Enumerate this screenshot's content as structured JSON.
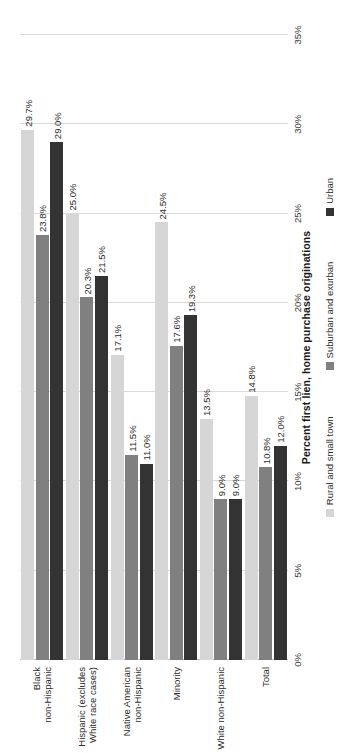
{
  "chart_data": {
    "type": "bar",
    "orientation": "horizontal",
    "title": "",
    "xlabel": "Percent first lien, home purchase originations",
    "ylabel": "",
    "xlim": [
      0,
      35
    ],
    "xticks": [
      "0%",
      "5%",
      "10%",
      "15%",
      "20%",
      "25%",
      "30%",
      "35%"
    ],
    "xtick_values": [
      0,
      5,
      10,
      15,
      20,
      25,
      30,
      35
    ],
    "grid": true,
    "legend_position": "bottom",
    "categories": [
      "Black\nnon-Hispanic",
      "Hispanic (excludes\nWhite race cases)",
      "Native American\nnon-Hispanic",
      "Minority",
      "White non-Hispanic",
      "Total"
    ],
    "series": [
      {
        "name": "Rural and small town",
        "color": "#d6d6d6",
        "values": [
          29.7,
          25.0,
          17.1,
          24.5,
          13.5,
          14.8
        ],
        "labels": [
          "29.7%",
          "25.0%",
          "17.1%",
          "24.5%",
          "13.5%",
          "14.8%"
        ]
      },
      {
        "name": "Suburban and exurban",
        "color": "#808080",
        "values": [
          23.8,
          20.3,
          11.5,
          17.6,
          9.0,
          10.8
        ],
        "labels": [
          "23.8%",
          "20.3%",
          "11.5%",
          "17.6%",
          "9.0%",
          "10.8%"
        ]
      },
      {
        "name": "Urban",
        "color": "#333333",
        "values": [
          29.0,
          21.5,
          11.0,
          19.3,
          9.0,
          12.0
        ],
        "labels": [
          "29.0%",
          "21.5%",
          "11.0%",
          "19.3%",
          "9.0%",
          "12.0%"
        ]
      }
    ]
  }
}
